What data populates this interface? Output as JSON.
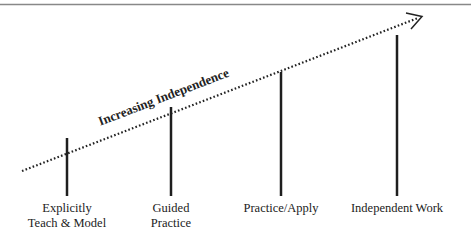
{
  "diagram": {
    "arrow_label": "Increasing Independence",
    "stages": [
      {
        "label_line1": "Explicitly",
        "label_line2": "Teach & Model"
      },
      {
        "label_line1": "Guided",
        "label_line2": "Practice"
      },
      {
        "label_line1": "Practice/Apply",
        "label_line2": ""
      },
      {
        "label_line1": "Independent Work",
        "label_line2": ""
      }
    ],
    "colors": {
      "line": "#1e1e1e",
      "border": "#888888",
      "text": "#222222"
    }
  }
}
